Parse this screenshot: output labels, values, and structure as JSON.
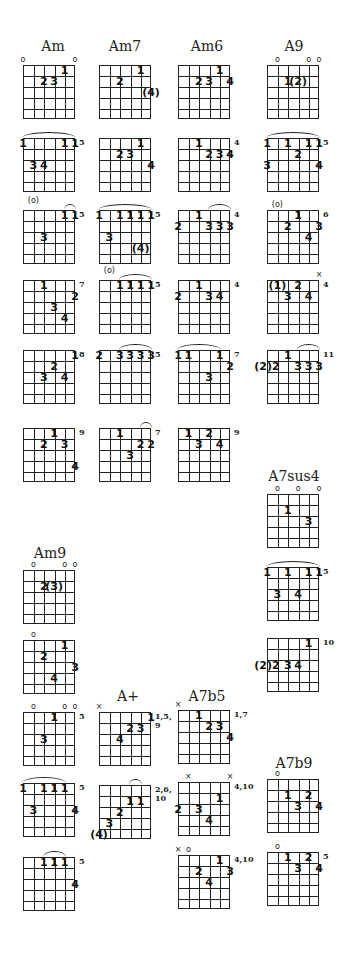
{
  "titles": [
    {
      "label": "Am",
      "x": 53,
      "y": 38
    },
    {
      "label": "Am7",
      "x": 125,
      "y": 38
    },
    {
      "label": "Am6",
      "x": 207,
      "y": 38
    },
    {
      "label": "A9",
      "x": 294,
      "y": 38
    },
    {
      "label": "A7sus4",
      "x": 294,
      "y": 468
    },
    {
      "label": "Am9",
      "x": 50,
      "y": 545
    },
    {
      "label": "A+",
      "x": 128,
      "y": 688
    },
    {
      "label": "A7b5",
      "x": 207,
      "y": 688
    },
    {
      "label": "A7b9",
      "x": 294,
      "y": 755
    }
  ],
  "diagrams": [
    {
      "chord": "Am",
      "x": 23,
      "y": 65,
      "top": [
        {
          "s": 1,
          "m": "o"
        },
        {
          "s": 6,
          "m": "o"
        }
      ],
      "dots": [
        {
          "s": 5,
          "f": 1,
          "t": "1"
        },
        {
          "s": 3,
          "f": 2,
          "t": "2"
        },
        {
          "s": 4,
          "f": 2,
          "t": "3"
        }
      ],
      "fret": ""
    },
    {
      "chord": "Am7",
      "x": 99,
      "y": 65,
      "top": [],
      "dots": [
        {
          "s": 5,
          "f": 1,
          "t": "1"
        },
        {
          "s": 3,
          "f": 2,
          "t": "2"
        },
        {
          "s": 6,
          "f": 3,
          "t": "(4)"
        }
      ],
      "fret": ""
    },
    {
      "chord": "Am6",
      "x": 178,
      "y": 65,
      "top": [],
      "dots": [
        {
          "s": 5,
          "f": 1,
          "t": "1"
        },
        {
          "s": 3,
          "f": 2,
          "t": "2"
        },
        {
          "s": 4,
          "f": 2,
          "t": "3"
        },
        {
          "s": 6,
          "f": 2,
          "t": "4"
        }
      ],
      "fret": ""
    },
    {
      "chord": "A9",
      "x": 267,
      "y": 65,
      "top": [
        {
          "s": 2,
          "m": "o"
        },
        {
          "s": 5,
          "m": "o"
        },
        {
          "s": 6,
          "m": "o"
        }
      ],
      "dots": [
        {
          "s": 3,
          "f": 2,
          "t": "1"
        },
        {
          "s": 4,
          "f": 2,
          "t": "(2)"
        }
      ],
      "fret": ""
    },
    {
      "chord": "Am",
      "x": 23,
      "y": 138,
      "top": [],
      "barre": [
        1,
        6
      ],
      "dots": [
        {
          "s": 1,
          "f": 1,
          "t": "1"
        },
        {
          "s": 5,
          "f": 1,
          "t": "1"
        },
        {
          "s": 6,
          "f": 1,
          "t": "1"
        },
        {
          "s": 2,
          "f": 3,
          "t": "3"
        },
        {
          "s": 3,
          "f": 3,
          "t": "4"
        }
      ],
      "fret": "5"
    },
    {
      "chord": "Am7",
      "x": 99,
      "y": 138,
      "top": [],
      "dots": [
        {
          "s": 5,
          "f": 1,
          "t": "1"
        },
        {
          "s": 3,
          "f": 2,
          "t": "2"
        },
        {
          "s": 4,
          "f": 2,
          "t": "3"
        },
        {
          "s": 6,
          "f": 3,
          "t": "4"
        }
      ],
      "fret": ""
    },
    {
      "chord": "Am6",
      "x": 178,
      "y": 138,
      "top": [],
      "dots": [
        {
          "s": 3,
          "f": 1,
          "t": "1"
        },
        {
          "s": 4,
          "f": 2,
          "t": "2"
        },
        {
          "s": 5,
          "f": 2,
          "t": "3"
        },
        {
          "s": 6,
          "f": 2,
          "t": "4"
        }
      ],
      "fret": "4"
    },
    {
      "chord": "A9",
      "x": 267,
      "y": 138,
      "top": [],
      "barre": [
        1,
        6
      ],
      "dots": [
        {
          "s": 1,
          "f": 1,
          "t": "1"
        },
        {
          "s": 3,
          "f": 1,
          "t": "1"
        },
        {
          "s": 5,
          "f": 1,
          "t": "1"
        },
        {
          "s": 6,
          "f": 1,
          "t": "1"
        },
        {
          "s": 4,
          "f": 2,
          "t": "2"
        },
        {
          "s": 1,
          "f": 3,
          "t": "3"
        },
        {
          "s": 6,
          "f": 3,
          "t": "4"
        }
      ],
      "fret": "5"
    },
    {
      "chord": "Am",
      "x": 23,
      "y": 210,
      "top": [
        {
          "s": 2,
          "m": "(o)"
        }
      ],
      "barre": [
        5,
        6
      ],
      "dots": [
        {
          "s": 5,
          "f": 1,
          "t": "1"
        },
        {
          "s": 6,
          "f": 1,
          "t": "1"
        },
        {
          "s": 3,
          "f": 3,
          "t": "3"
        }
      ],
      "fret": "5"
    },
    {
      "chord": "Am7",
      "x": 99,
      "y": 210,
      "top": [],
      "barre": [
        1,
        6
      ],
      "dots": [
        {
          "s": 1,
          "f": 1,
          "t": "1"
        },
        {
          "s": 3,
          "f": 1,
          "t": "1"
        },
        {
          "s": 4,
          "f": 1,
          "t": "1"
        },
        {
          "s": 5,
          "f": 1,
          "t": "1"
        },
        {
          "s": 6,
          "f": 1,
          "t": "1"
        },
        {
          "s": 2,
          "f": 3,
          "t": "3"
        },
        {
          "s": 5,
          "f": 4,
          "t": "(4)"
        }
      ],
      "fret": "5"
    },
    {
      "chord": "Am6",
      "x": 178,
      "y": 210,
      "top": [],
      "barre": [
        4,
        6
      ],
      "dots": [
        {
          "s": 1,
          "f": 2,
          "t": "2"
        },
        {
          "s": 3,
          "f": 1,
          "t": "1"
        },
        {
          "s": 4,
          "f": 2,
          "t": "3"
        },
        {
          "s": 5,
          "f": 2,
          "t": "3"
        },
        {
          "s": 6,
          "f": 2,
          "t": "3"
        }
      ],
      "fret": "4"
    },
    {
      "chord": "A9",
      "x": 267,
      "y": 210,
      "top": [
        {
          "s": 2,
          "m": "(o)"
        }
      ],
      "dots": [
        {
          "s": 4,
          "f": 1,
          "t": "1"
        },
        {
          "s": 3,
          "f": 2,
          "t": "2"
        },
        {
          "s": 6,
          "f": 2,
          "t": "3"
        },
        {
          "s": 5,
          "f": 3,
          "t": "4"
        }
      ],
      "fret": "6"
    },
    {
      "chord": "Am",
      "x": 23,
      "y": 280,
      "top": [],
      "dots": [
        {
          "s": 3,
          "f": 1,
          "t": "1"
        },
        {
          "s": 6,
          "f": 2,
          "t": "2"
        },
        {
          "s": 4,
          "f": 3,
          "t": "3"
        },
        {
          "s": 5,
          "f": 4,
          "t": "4"
        }
      ],
      "fret": "7"
    },
    {
      "chord": "Am7",
      "x": 99,
      "y": 280,
      "top": [
        {
          "s": 2,
          "m": "(o)"
        }
      ],
      "barre": [
        3,
        6
      ],
      "dots": [
        {
          "s": 3,
          "f": 1,
          "t": "1"
        },
        {
          "s": 4,
          "f": 1,
          "t": "1"
        },
        {
          "s": 5,
          "f": 1,
          "t": "1"
        },
        {
          "s": 6,
          "f": 1,
          "t": "1"
        }
      ],
      "fret": "5"
    },
    {
      "chord": "Am6",
      "x": 178,
      "y": 280,
      "top": [],
      "dots": [
        {
          "s": 1,
          "f": 2,
          "t": "2"
        },
        {
          "s": 3,
          "f": 1,
          "t": "1"
        },
        {
          "s": 4,
          "f": 2,
          "t": "3"
        },
        {
          "s": 5,
          "f": 2,
          "t": "4"
        }
      ],
      "fret": "4"
    },
    {
      "chord": "A9",
      "x": 267,
      "y": 280,
      "top": [
        {
          "s": 6,
          "m": "×"
        }
      ],
      "dots": [
        {
          "s": 2,
          "f": 1,
          "t": "(1)"
        },
        {
          "s": 4,
          "f": 1,
          "t": "2"
        },
        {
          "s": 3,
          "f": 2,
          "t": "3"
        },
        {
          "s": 5,
          "f": 2,
          "t": "4"
        }
      ],
      "fret": "4"
    },
    {
      "chord": "Am",
      "x": 23,
      "y": 350,
      "top": [],
      "dots": [
        {
          "s": 6,
          "f": 1,
          "t": "1"
        },
        {
          "s": 4,
          "f": 2,
          "t": "2"
        },
        {
          "s": 3,
          "f": 3,
          "t": "3"
        },
        {
          "s": 5,
          "f": 3,
          "t": "4"
        }
      ],
      "fret": "8"
    },
    {
      "chord": "Am7",
      "x": 99,
      "y": 350,
      "top": [],
      "barre": [
        3,
        6
      ],
      "dots": [
        {
          "s": 1,
          "f": 1,
          "t": "2"
        },
        {
          "s": 3,
          "f": 1,
          "t": "3"
        },
        {
          "s": 4,
          "f": 1,
          "t": "3"
        },
        {
          "s": 5,
          "f": 1,
          "t": "3"
        },
        {
          "s": 6,
          "f": 1,
          "t": "3"
        }
      ],
      "fret": "5"
    },
    {
      "chord": "Am6",
      "x": 178,
      "y": 350,
      "top": [],
      "barre": [
        1,
        5
      ],
      "dots": [
        {
          "s": 1,
          "f": 1,
          "t": "1"
        },
        {
          "s": 2,
          "f": 1,
          "t": "1"
        },
        {
          "s": 5,
          "f": 1,
          "t": "1"
        },
        {
          "s": 6,
          "f": 2,
          "t": "2"
        },
        {
          "s": 4,
          "f": 3,
          "t": "3"
        }
      ],
      "fret": "7"
    },
    {
      "chord": "A9",
      "x": 267,
      "y": 350,
      "top": [],
      "barre": [
        4,
        6
      ],
      "dots": [
        {
          "s": 1,
          "f": 2,
          "t": "(2)2"
        },
        {
          "s": 3,
          "f": 1,
          "t": "1"
        },
        {
          "s": 4,
          "f": 2,
          "t": "3"
        },
        {
          "s": 5,
          "f": 2,
          "t": "3"
        },
        {
          "s": 6,
          "f": 2,
          "t": "3"
        }
      ],
      "fret": "11"
    },
    {
      "chord": "Am",
      "x": 23,
      "y": 428,
      "top": [],
      "dots": [
        {
          "s": 4,
          "f": 1,
          "t": "1"
        },
        {
          "s": 3,
          "f": 2,
          "t": "2"
        },
        {
          "s": 5,
          "f": 2,
          "t": "3"
        },
        {
          "s": 6,
          "f": 4,
          "t": "4"
        }
      ],
      "fret": "9"
    },
    {
      "chord": "Am7",
      "x": 99,
      "y": 428,
      "top": [],
      "barre": [
        5,
        6
      ],
      "dots": [
        {
          "s": 3,
          "f": 1,
          "t": "1"
        },
        {
          "s": 5,
          "f": 2,
          "t": "2"
        },
        {
          "s": 6,
          "f": 2,
          "t": "2"
        },
        {
          "s": 4,
          "f": 3,
          "t": "3"
        }
      ],
      "fret": "7"
    },
    {
      "chord": "Am6",
      "x": 178,
      "y": 428,
      "top": [],
      "dots": [
        {
          "s": 2,
          "f": 1,
          "t": "1"
        },
        {
          "s": 4,
          "f": 1,
          "t": "2"
        },
        {
          "s": 3,
          "f": 2,
          "t": "3"
        },
        {
          "s": 5,
          "f": 2,
          "t": "4"
        }
      ],
      "fret": "9"
    },
    {
      "chord": "A7sus4",
      "x": 267,
      "y": 494,
      "top": [
        {
          "s": 2,
          "m": "o"
        },
        {
          "s": 4,
          "m": "o"
        },
        {
          "s": 6,
          "m": "o"
        }
      ],
      "dots": [
        {
          "s": 3,
          "f": 2,
          "t": "1"
        },
        {
          "s": 5,
          "f": 3,
          "t": "3"
        }
      ],
      "fret": ""
    },
    {
      "chord": "A7sus4",
      "x": 267,
      "y": 567,
      "top": [],
      "barre": [
        1,
        6
      ],
      "dots": [
        {
          "s": 1,
          "f": 1,
          "t": "1"
        },
        {
          "s": 3,
          "f": 1,
          "t": "1"
        },
        {
          "s": 5,
          "f": 1,
          "t": "1"
        },
        {
          "s": 6,
          "f": 1,
          "t": "1"
        },
        {
          "s": 2,
          "f": 3,
          "t": "3"
        },
        {
          "s": 4,
          "f": 3,
          "t": "4"
        }
      ],
      "fret": "5"
    },
    {
      "chord": "A7sus4",
      "x": 267,
      "y": 638,
      "top": [],
      "dots": [
        {
          "s": 5,
          "f": 1,
          "t": "1"
        },
        {
          "s": 1,
          "f": 3,
          "t": "(2)2"
        },
        {
          "s": 3,
          "f": 3,
          "t": "3"
        },
        {
          "s": 4,
          "f": 3,
          "t": "4"
        }
      ],
      "fret": "10"
    },
    {
      "chord": "Am9",
      "x": 23,
      "y": 570,
      "top": [
        {
          "s": 2,
          "m": "o"
        },
        {
          "s": 5,
          "m": "o"
        },
        {
          "s": 6,
          "m": "o"
        }
      ],
      "dots": [
        {
          "s": 3,
          "f": 2,
          "t": "2"
        },
        {
          "s": 4,
          "f": 2,
          "t": "(3)"
        }
      ],
      "fret": ""
    },
    {
      "chord": "Am9",
      "x": 23,
      "y": 640,
      "top": [
        {
          "s": 2,
          "m": "o"
        }
      ],
      "dots": [
        {
          "s": 5,
          "f": 1,
          "t": "1"
        },
        {
          "s": 3,
          "f": 2,
          "t": "2"
        },
        {
          "s": 6,
          "f": 3,
          "t": "3"
        },
        {
          "s": 4,
          "f": 4,
          "t": "4"
        }
      ],
      "fret": ""
    },
    {
      "chord": "Am9",
      "x": 23,
      "y": 712,
      "top": [
        {
          "s": 2,
          "m": "o"
        },
        {
          "s": 5,
          "m": "o"
        },
        {
          "s": 6,
          "m": "o"
        }
      ],
      "dots": [
        {
          "s": 4,
          "f": 1,
          "t": "1"
        },
        {
          "s": 3,
          "f": 3,
          "t": "3"
        }
      ],
      "fret": "5"
    },
    {
      "chord": "Am9",
      "x": 23,
      "y": 783,
      "top": [],
      "barre": [
        1,
        5
      ],
      "dots": [
        {
          "s": 1,
          "f": 1,
          "t": "1"
        },
        {
          "s": 3,
          "f": 1,
          "t": "1"
        },
        {
          "s": 4,
          "f": 1,
          "t": "1"
        },
        {
          "s": 5,
          "f": 1,
          "t": "1"
        },
        {
          "s": 2,
          "f": 3,
          "t": "3"
        },
        {
          "s": 6,
          "f": 3,
          "t": "4"
        }
      ],
      "fret": "5"
    },
    {
      "chord": "Am9",
      "x": 23,
      "y": 857,
      "top": [],
      "barre": [
        3,
        5
      ],
      "dots": [
        {
          "s": 3,
          "f": 1,
          "t": "1"
        },
        {
          "s": 4,
          "f": 1,
          "t": "1"
        },
        {
          "s": 5,
          "f": 1,
          "t": "1"
        },
        {
          "s": 6,
          "f": 3,
          "t": "4"
        }
      ],
      "fret": "5"
    },
    {
      "chord": "A+",
      "x": 99,
      "y": 712,
      "top": [
        {
          "s": 1,
          "m": "×"
        }
      ],
      "dots": [
        {
          "s": 6,
          "f": 1,
          "t": "1"
        },
        {
          "s": 4,
          "f": 2,
          "t": "2"
        },
        {
          "s": 5,
          "f": 2,
          "t": "3"
        },
        {
          "s": 3,
          "f": 3,
          "t": "4"
        }
      ],
      "fret": "1,5,\n9"
    },
    {
      "chord": "A+",
      "x": 99,
      "y": 785,
      "top": [],
      "barre": [
        4,
        5
      ],
      "dots": [
        {
          "s": 4,
          "f": 2,
          "t": "1"
        },
        {
          "s": 5,
          "f": 2,
          "t": "1"
        },
        {
          "s": 3,
          "f": 3,
          "t": "2"
        },
        {
          "s": 2,
          "f": 4,
          "t": "3"
        },
        {
          "s": 1,
          "f": 5,
          "t": "(4)"
        }
      ],
      "fret": "2,6,\n10"
    },
    {
      "chord": "A7b5",
      "x": 178,
      "y": 710,
      "top": [
        {
          "s": 1,
          "m": "×"
        }
      ],
      "dots": [
        {
          "s": 3,
          "f": 1,
          "t": "1"
        },
        {
          "s": 4,
          "f": 2,
          "t": "2"
        },
        {
          "s": 5,
          "f": 2,
          "t": "3"
        },
        {
          "s": 6,
          "f": 3,
          "t": "4"
        }
      ],
      "fret": "1,7"
    },
    {
      "chord": "A7b5",
      "x": 178,
      "y": 782,
      "top": [
        {
          "s": 2,
          "m": "×"
        },
        {
          "s": 6,
          "m": "×"
        }
      ],
      "dots": [
        {
          "s": 5,
          "f": 2,
          "t": "1"
        },
        {
          "s": 1,
          "f": 3,
          "t": "2"
        },
        {
          "s": 3,
          "f": 3,
          "t": "3"
        },
        {
          "s": 4,
          "f": 4,
          "t": "4"
        }
      ],
      "fret": "4,10"
    },
    {
      "chord": "A7b5",
      "x": 178,
      "y": 855,
      "top": [
        {
          "s": 1,
          "m": "×"
        },
        {
          "s": 2,
          "m": "o"
        }
      ],
      "dots": [
        {
          "s": 5,
          "f": 1,
          "t": "1"
        },
        {
          "s": 3,
          "f": 2,
          "t": "2"
        },
        {
          "s": 6,
          "f": 2,
          "t": "3"
        },
        {
          "s": 4,
          "f": 3,
          "t": "4"
        }
      ],
      "fret": "4,10"
    },
    {
      "chord": "A7b9",
      "x": 267,
      "y": 779,
      "top": [
        {
          "s": 2,
          "m": "o"
        }
      ],
      "dots": [
        {
          "s": 3,
          "f": 2,
          "t": "1"
        },
        {
          "s": 5,
          "f": 2,
          "t": "2"
        },
        {
          "s": 4,
          "f": 3,
          "t": "3"
        },
        {
          "s": 6,
          "f": 3,
          "t": "4"
        }
      ],
      "fret": ""
    },
    {
      "chord": "A7b9",
      "x": 267,
      "y": 852,
      "top": [
        {
          "s": 2,
          "m": "o"
        }
      ],
      "dots": [
        {
          "s": 3,
          "f": 1,
          "t": "1"
        },
        {
          "s": 5,
          "f": 1,
          "t": "2"
        },
        {
          "s": 4,
          "f": 2,
          "t": "3"
        },
        {
          "s": 6,
          "f": 2,
          "t": "4"
        }
      ],
      "fret": "5"
    }
  ]
}
